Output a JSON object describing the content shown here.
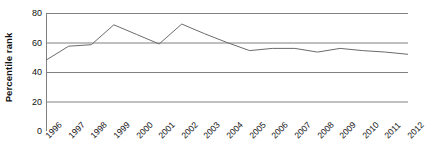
{
  "chart_data": {
    "type": "line",
    "title": "",
    "xlabel": "",
    "ylabel": "Percentile rank",
    "ylim": [
      0,
      80
    ],
    "yticks": [
      0,
      20,
      40,
      60,
      80
    ],
    "grid": "horizontal",
    "legend": "none",
    "categories": [
      "1996",
      "1997",
      "1998",
      "1999",
      "2000",
      "2001",
      "2002",
      "2003",
      "2004",
      "2005",
      "2006",
      "2007",
      "2008",
      "2009",
      "2010",
      "2011",
      "2012"
    ],
    "series": [
      {
        "name": "Percentile rank",
        "color": "#6b6b6b",
        "values": [
          48,
          57.5,
          58.5,
          72,
          65.5,
          59,
          72.5,
          66,
          60,
          54.5,
          56,
          56,
          53.5,
          56,
          54.5,
          53.5,
          52
        ]
      }
    ]
  },
  "axis": {
    "y_title": "Percentile rank",
    "y_tick_labels": [
      "80",
      "60",
      "40",
      "20",
      "0"
    ],
    "x_tick_labels": [
      "1996",
      "1997",
      "1998",
      "1999",
      "2000",
      "2001",
      "2002",
      "2003",
      "2004",
      "2005",
      "2006",
      "2007",
      "2008",
      "2009",
      "2010",
      "2011",
      "2012"
    ]
  },
  "style": {
    "grid_color": "#808080",
    "line_color": "#6b6b6b",
    "text_color": "#111111",
    "background": "#ffffff"
  }
}
